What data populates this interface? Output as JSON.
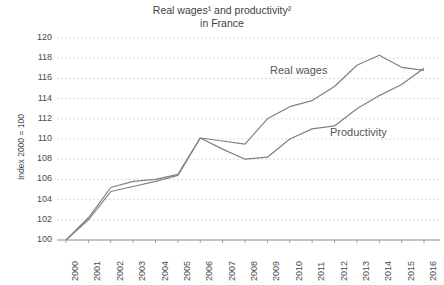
{
  "chart_data": {
    "type": "line",
    "title": "Real wages¹ and productivity² in France",
    "title_line1": "Real wages¹ and productivity²",
    "title_line2": "in France",
    "xlabel": "",
    "ylabel": "Index 2000 = 100",
    "ylim": [
      100,
      120
    ],
    "ytick_step": 2,
    "grid": true,
    "legend_position": "inline-annotation",
    "categories": [
      "2000",
      "2001",
      "2002",
      "2003",
      "2004",
      "2005",
      "2006",
      "2007",
      "2008",
      "2009",
      "2010",
      "2011",
      "2012",
      "2013",
      "2014",
      "2015",
      "2016"
    ],
    "series": [
      {
        "name": "Real wages",
        "color": "#808080",
        "values": [
          100.0,
          102.2,
          105.2,
          105.8,
          106.0,
          106.5,
          110.1,
          109.8,
          109.5,
          112.0,
          113.2,
          113.8,
          115.2,
          117.3,
          118.3,
          117.1,
          116.8
        ]
      },
      {
        "name": "Productivity",
        "color": "#808080",
        "values": [
          100.0,
          102.0,
          104.8,
          105.3,
          105.8,
          106.4,
          110.1,
          109.0,
          108.0,
          108.2,
          110.0,
          111.0,
          111.3,
          113.0,
          114.3,
          115.4,
          117.0
        ]
      }
    ],
    "yticks": [
      "120",
      "118",
      "116",
      "114",
      "112",
      "110",
      "108",
      "106",
      "104",
      "102",
      "100"
    ],
    "annotations": [
      {
        "text": "Real wages",
        "x_year": 2011,
        "y_value": 115.8
      },
      {
        "text": "Productivity",
        "x_value": 2013,
        "y_value": 112.0
      }
    ]
  },
  "axis": {
    "y_axis_title": "Index 2000 = 100"
  },
  "labels": {
    "real_wages": "Real wages",
    "productivity": "Productivity"
  }
}
